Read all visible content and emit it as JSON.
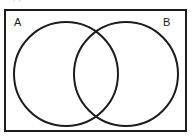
{
  "figure": {
    "type": "venn-diagram",
    "title_strip_text": "clipped header text",
    "background_color": "#ffffff",
    "stroke_color": "#1c1c1c",
    "universe": {
      "name": "universal-set-rectangle",
      "x": 4,
      "y": 9,
      "width": 183,
      "height": 123,
      "border_width": 2,
      "fill": "none"
    },
    "sets": [
      {
        "label": "A",
        "name": "set-a",
        "cx": 66,
        "cy": 74,
        "r": 52,
        "stroke": "#1c1c1c",
        "stroke_width": 2,
        "fill": "none",
        "label_x": 14,
        "label_y": 17
      },
      {
        "label": "B",
        "name": "set-b",
        "cx": 126,
        "cy": 74,
        "r": 52,
        "stroke": "#1c1c1c",
        "stroke_width": 2,
        "fill": "none",
        "label_x": 163,
        "label_y": 17
      }
    ],
    "regions": {
      "a_only": "unshaded",
      "b_only": "unshaded",
      "intersection": "unshaded",
      "outside": "unshaded"
    }
  }
}
